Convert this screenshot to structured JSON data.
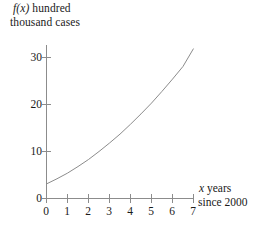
{
  "chart_data": {
    "type": "line",
    "title": "",
    "ylabel_line1": "f(x) hundred",
    "ylabel_line2": "thousand cases",
    "ylabel_italic_part": "f(x)",
    "xlabel_line1": "x years",
    "xlabel_line2": "since 2000",
    "xlabel_italic_part": "x",
    "xlim": [
      0,
      7
    ],
    "ylim": [
      0,
      33
    ],
    "xticks": [
      0,
      1,
      2,
      3,
      4,
      5,
      6,
      7
    ],
    "yticks": [
      0,
      10,
      20,
      30
    ],
    "xtick_labels": [
      "0",
      "1",
      "2",
      "3",
      "4",
      "5",
      "6",
      "7"
    ],
    "ytick_labels": [
      "0",
      "10",
      "20",
      "30"
    ],
    "grid": false,
    "legend": null,
    "series": [
      {
        "name": "f(x)",
        "x": [
          0,
          0.5,
          1,
          1.5,
          2,
          2.5,
          3,
          3.5,
          4,
          4.5,
          5,
          5.5,
          6,
          6.5,
          7
        ],
        "values": [
          3.1,
          4.2,
          5.4,
          6.8,
          8.3,
          10.0,
          11.8,
          13.7,
          15.8,
          18.0,
          20.3,
          22.8,
          25.4,
          28.1,
          31.9
        ],
        "color": "#8c8c8c"
      }
    ],
    "axis_color": "#8c8c8c",
    "background": "#ffffff"
  }
}
